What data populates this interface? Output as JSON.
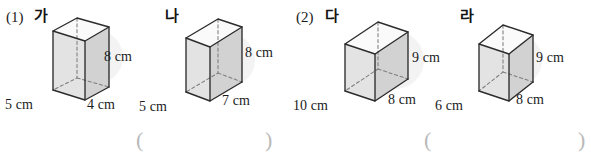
{
  "page": {
    "width": 591,
    "height": 160,
    "background": "#ffffff",
    "ink_color": "#1b1b1b",
    "face_fill_light": "#f2f2f2",
    "face_fill_mid": "#dcdcdc",
    "face_fill_dark": "#c9c9c9",
    "paren_color": "#b9b9b9"
  },
  "problems": [
    {
      "number": "(1)",
      "figures": [
        {
          "label": "가",
          "dims": {
            "width": "5 cm",
            "depth": "4 cm",
            "height": "8 cm"
          }
        },
        {
          "label": "나",
          "dims": {
            "width": "5 cm",
            "depth": "7 cm",
            "height": "8 cm"
          }
        }
      ],
      "answer_open": "(",
      "answer_close": ")"
    },
    {
      "number": "(2)",
      "figures": [
        {
          "label": "다",
          "dims": {
            "width": "10 cm",
            "depth": "8 cm",
            "height": "9 cm"
          }
        },
        {
          "label": "라",
          "dims": {
            "width": "6 cm",
            "depth": "8 cm",
            "height": "9 cm"
          }
        }
      ],
      "answer_open": "(",
      "answer_close": ")"
    }
  ],
  "labels_flat": {
    "p1_number": "(1)",
    "p1_fig1_name": "가",
    "p1_fig1_w": "5 cm",
    "p1_fig1_d": "4 cm",
    "p1_fig1_h": "8 cm",
    "p1_fig2_name": "나",
    "p1_fig2_w": "5 cm",
    "p1_fig2_d": "7 cm",
    "p1_fig2_h": "8 cm",
    "p1_paren_open": "(",
    "p1_paren_close": ")",
    "p2_number": "(2)",
    "p2_fig1_name": "다",
    "p2_fig1_w": "10 cm",
    "p2_fig1_d": "8 cm",
    "p2_fig1_h": "9 cm",
    "p2_fig2_name": "라",
    "p2_fig2_w": "6 cm",
    "p2_fig2_d": "8 cm",
    "p2_fig2_h": "9 cm",
    "p2_paren_open": "(",
    "p2_paren_close": ")"
  }
}
